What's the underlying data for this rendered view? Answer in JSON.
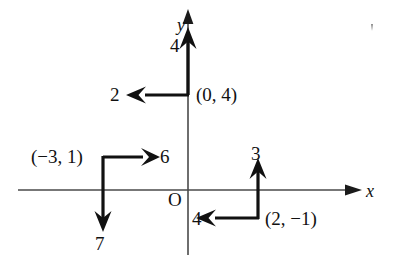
{
  "figure": {
    "background_color": "#ffffff",
    "ink_color": "#111111",
    "axis_color": "#555555",
    "width": 395,
    "height": 269
  },
  "axes": {
    "x_label": "x",
    "y_label": "y",
    "origin_label": "O",
    "x_axis_name": "horizontal-axis",
    "y_axis_name": "vertical-axis",
    "origin_px": {
      "x": 188,
      "y": 190
    }
  },
  "vectors": [
    {
      "id": "vector-from-0-4",
      "point_label": "(0, 4)",
      "start_px": {
        "x": 188,
        "y": 95
      },
      "components": [
        {
          "name": "upward-component",
          "magnitude_label": "4",
          "direction": "up",
          "from_px": {
            "x": 188,
            "y": 95
          },
          "to_px": {
            "x": 188,
            "y": 34
          }
        },
        {
          "name": "leftward-component",
          "magnitude_label": "2",
          "direction": "left",
          "from_px": {
            "x": 188,
            "y": 95
          },
          "to_px": {
            "x": 137,
            "y": 95
          }
        }
      ]
    },
    {
      "id": "vector-from-neg3-1",
      "point_label": "(−3, 1)",
      "start_px": {
        "x": 103,
        "y": 157
      },
      "components": [
        {
          "name": "rightward-component",
          "magnitude_label": "6",
          "direction": "right",
          "from_px": {
            "x": 103,
            "y": 157
          },
          "to_px": {
            "x": 152,
            "y": 157
          }
        },
        {
          "name": "downward-component",
          "magnitude_label": "7",
          "direction": "down",
          "from_px": {
            "x": 103,
            "y": 157
          },
          "to_px": {
            "x": 103,
            "y": 228
          }
        }
      ]
    },
    {
      "id": "vector-from-2-neg1",
      "point_label": "(2, −1)",
      "start_px": {
        "x": 258,
        "y": 218
      },
      "components": [
        {
          "name": "upward-component",
          "magnitude_label": "3",
          "direction": "up",
          "from_px": {
            "x": 258,
            "y": 218
          },
          "to_px": {
            "x": 258,
            "y": 162
          }
        },
        {
          "name": "leftward-component",
          "magnitude_label": "4",
          "direction": "left",
          "from_px": {
            "x": 258,
            "y": 218
          },
          "to_px": {
            "x": 206,
            "y": 218
          }
        }
      ]
    }
  ],
  "labels": {
    "y_axis": "y",
    "x_axis": "x",
    "origin": "O",
    "mag_4_top": "4",
    "mag_2_left": "2",
    "point_0_4": "(0, 4)",
    "point_neg3_1": "(−3, 1)",
    "mag_6_right": "6",
    "mag_7_down": "7",
    "mag_3_up": "3",
    "mag_4_left": "4",
    "point_2_neg1": "(2, −1)",
    "stray_mark": "’"
  }
}
